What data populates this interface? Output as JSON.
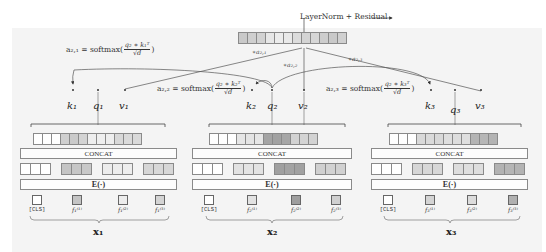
{
  "header": {
    "layernorm_label": "LayerNorm + Residual",
    "output_cells": [
      "#c9c9c9",
      "#cfcfcf",
      "#d2d2d2",
      "#e7e7e7",
      "#ececec",
      "#e9e9e9",
      "#dcdcdc",
      "#d4d4d4",
      "#d6d6d6",
      "#cdcdcd",
      "#c9c9c9",
      "#d0d0d0"
    ]
  },
  "attention_weights": {
    "a21_tag": "∗a₂,₁",
    "a22_tag": "∗a₂,₂",
    "a23_tag": "∗a₂,₃"
  },
  "formulas": [
    {
      "lhs": "a₂,₁ = softmax(",
      "num": "q₂ ∗ k₁ᵀ",
      "den": "√d",
      "rhs": ")"
    },
    {
      "lhs": "a₂,₂ = softmax(",
      "num": "q₂ ∗ k₂ᵀ",
      "den": "√d",
      "rhs": ")"
    },
    {
      "lhs": "a₂,₃ = softmax(",
      "num": "q₂ ∗ k₃ᵀ",
      "den": "√d",
      "rhs": ")"
    }
  ],
  "groups": [
    {
      "k": "k₁",
      "q": "q₁",
      "v": "v₁",
      "output_cells": [
        "#ffffff",
        "#ffffff",
        "#ffffff",
        "#cfcfcf",
        "#cacaca",
        "#d3d3d3",
        "#eeeeee",
        "#efefef",
        "#eeeeee",
        "#d8d8d8",
        "#dadada",
        "#d9d9d9"
      ],
      "concat_label": "CONCAT",
      "embed_groups": [
        [
          "#ffffff",
          "#ffffff",
          "#ffffff"
        ],
        [
          "#c4c4c4",
          "#c6c6c6",
          "#c8c8c8"
        ],
        [
          "#ececec",
          "#ededed",
          "#eeeeee"
        ],
        [
          "#d6d6d6",
          "#d8d8d8",
          "#d7d7d7"
        ]
      ],
      "embed_label": "E(·)",
      "tokens": [
        {
          "label": "[CLS]",
          "color": "#ffffff"
        },
        {
          "label": "f₁⁽¹⁾",
          "color": "#c4c4c4"
        },
        {
          "label": "f₁⁽²⁾",
          "color": "#ececec"
        },
        {
          "label": "f₁⁽³⁾",
          "color": "#d4d4d4"
        }
      ],
      "x_label": "x₁"
    },
    {
      "k": "k₂",
      "q": "q₂",
      "v": "v₂",
      "output_cells": [
        "#ffffff",
        "#ffffff",
        "#ffffff",
        "#e6e6e6",
        "#e4e4e4",
        "#e6e6e6",
        "#a4a4a4",
        "#a2a2a2",
        "#a6a6a6",
        "#d2d2d2",
        "#d4d4d4",
        "#d3d3d3"
      ],
      "concat_label": "CONCAT",
      "embed_groups": [
        [
          "#ffffff",
          "#ffffff",
          "#ffffff"
        ],
        [
          "#e2e2e2",
          "#e4e4e4",
          "#e3e3e3"
        ],
        [
          "#a0a0a0",
          "#a3a3a3",
          "#a1a1a1"
        ],
        [
          "#d0d0d0",
          "#d2d2d2",
          "#d1d1d1"
        ]
      ],
      "embed_label": "E(·)",
      "tokens": [
        {
          "label": "[CLS]",
          "color": "#ffffff"
        },
        {
          "label": "f₂⁽¹⁾",
          "color": "#e2e2e2"
        },
        {
          "label": "f₂⁽²⁾",
          "color": "#9e9e9e"
        },
        {
          "label": "f₂⁽³⁾",
          "color": "#d0d0d0"
        }
      ],
      "x_label": "x₂"
    },
    {
      "k": "k₃",
      "q": "q₃",
      "v": "v₃",
      "output_cells": [
        "#ffffff",
        "#ffffff",
        "#ffffff",
        "#d9d9d9",
        "#dadada",
        "#d8d8d8",
        "#dedede",
        "#dddddd",
        "#dfdfdf",
        "#b4b4b4",
        "#b6b6b6",
        "#b3b3b3"
      ],
      "concat_label": "CONCAT",
      "embed_groups": [
        [
          "#ffffff",
          "#ffffff",
          "#ffffff"
        ],
        [
          "#d6d6d6",
          "#d8d8d8",
          "#d7d7d7"
        ],
        [
          "#dddddd",
          "#dfdfdf",
          "#dedede"
        ],
        [
          "#b2b2b2",
          "#b5b5b5",
          "#b3b3b3"
        ]
      ],
      "embed_label": "E(·)",
      "tokens": [
        {
          "label": "[CLS]",
          "color": "#ffffff"
        },
        {
          "label": "f₃⁽¹⁾",
          "color": "#d4d4d4"
        },
        {
          "label": "f₃⁽²⁾",
          "color": "#dcdcdc"
        },
        {
          "label": "f₃⁽³⁾",
          "color": "#b0b0b0"
        }
      ],
      "x_label": "x₃"
    }
  ]
}
